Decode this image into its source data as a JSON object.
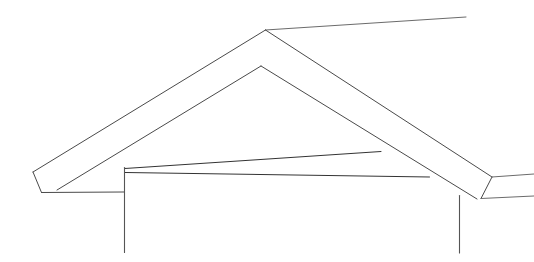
{
  "drawing": {
    "title": "Roof Truss Cross-Section",
    "subject": "gable-roof-truss",
    "background_color": "#ffffff",
    "line_color": "#4a4a4a",
    "accent_line_color": "#333333",
    "canvas": {
      "width": 534,
      "height": 262
    },
    "style": "monochrome technical line drawing, no text labels, no dimensions",
    "geometry": {
      "ridge_apex": {
        "x": 265,
        "y": 30
      },
      "inner_apex": {
        "x": 261,
        "y": 66
      },
      "left_eave_tip": {
        "x": 33,
        "y": 172
      },
      "right_eave_tip": {
        "x": 534,
        "y": 176
      },
      "left_wall_x": 124,
      "right_wall_x": 459,
      "wall_top_left_y": 168,
      "wall_top_right_y": 196,
      "wall_bottom_y": 253,
      "tie_beam_left": {
        "x": 125,
        "y": 168
      },
      "tie_beam_upper_right": {
        "x": 381,
        "y": 152
      },
      "tie_beam_lower_right": {
        "x": 429,
        "y": 177
      },
      "soffit_left_y": 192,
      "roof_top_right_end": {
        "x": 466,
        "y": 17
      }
    },
    "parts": [
      {
        "name": "left-rafter-outer-edge",
        "from": [
          33,
          172
        ],
        "to": [
          265,
          30
        ]
      },
      {
        "name": "left-rafter-inner-edge",
        "from": [
          57,
          190
        ],
        "to": [
          261,
          66
        ]
      },
      {
        "name": "right-rafter-outer-edge",
        "from": [
          265,
          30
        ],
        "to": [
          466,
          17
        ]
      },
      {
        "name": "right-rafter-lower-outer-edge",
        "from": [
          265,
          30
        ],
        "to": [
          534,
          176
        ]
      },
      {
        "name": "right-rafter-inner-edge",
        "from": [
          261,
          66
        ],
        "to": [
          534,
          206
        ]
      },
      {
        "name": "left-eave-cut",
        "from": [
          33,
          172
        ],
        "to": [
          41,
          192
        ]
      },
      {
        "name": "left-soffit",
        "from": [
          41,
          192
        ],
        "to": [
          124,
          192
        ]
      },
      {
        "name": "right-eave-cut",
        "from": [
          489,
          178
        ],
        "to": [
          479,
          198
        ]
      },
      {
        "name": "tie-beam-top-chord",
        "from": [
          125,
          168
        ],
        "to": [
          381,
          152
        ]
      },
      {
        "name": "tie-beam-bottom-chord",
        "from": [
          125,
          172
        ],
        "to": [
          429,
          177
        ]
      },
      {
        "name": "left-wall",
        "from": [
          124,
          168
        ],
        "to": [
          124,
          252
        ]
      },
      {
        "name": "right-wall",
        "from": [
          459,
          196
        ],
        "to": [
          459,
          253
        ]
      }
    ]
  }
}
